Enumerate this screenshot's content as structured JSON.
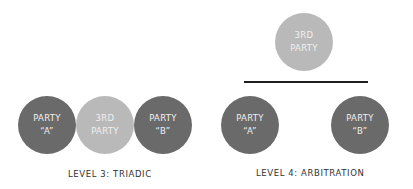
{
  "colors": {
    "party": "#6a6a6a",
    "third_party": "#b9b9b9",
    "line": "#1f1f1f",
    "caption": "#333333"
  },
  "level3": {
    "caption": "LEVEL 3: TRIADIC",
    "nodes": [
      {
        "line1": "PARTY",
        "line2": "“A”"
      },
      {
        "line1": "3RD",
        "line2": "PARTY"
      },
      {
        "line1": "PARTY",
        "line2": "“B”"
      }
    ]
  },
  "level4": {
    "caption": "LEVEL 4: ARBITRATION",
    "third": {
      "line1": "3RD",
      "line2": "PARTY"
    },
    "nodes": [
      {
        "line1": "PARTY",
        "line2": "“A”"
      },
      {
        "line1": "PARTY",
        "line2": "“B”"
      }
    ]
  }
}
